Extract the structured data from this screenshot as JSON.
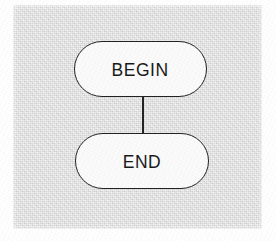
{
  "document": {
    "type": "flowchart",
    "title": "",
    "background_color": "#dedede",
    "page_margin_color": "#ffffff"
  },
  "diagram": {
    "shape_fill_color": "#fbfbfb",
    "shape_stroke_color": "#232323",
    "connector_color": "#242424",
    "nodes": [
      {
        "id": "begin",
        "label": "BEGIN",
        "shape": "stadium",
        "x": 74,
        "y": 41,
        "width": 133,
        "height": 56
      },
      {
        "id": "end",
        "label": "END",
        "shape": "stadium",
        "x": 75,
        "y": 133,
        "width": 134,
        "height": 56
      }
    ],
    "edges": [
      {
        "id": "begin-to-end",
        "from": "begin",
        "to": "end",
        "label": "",
        "style": "solid-line",
        "arrowhead": "none"
      }
    ]
  }
}
